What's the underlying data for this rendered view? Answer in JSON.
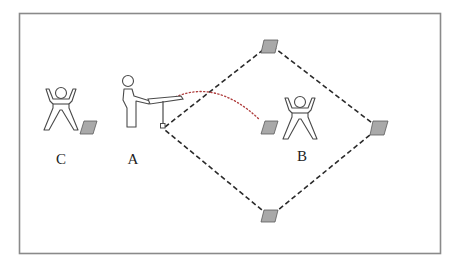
{
  "diagram": {
    "title": "",
    "players": {
      "A": {
        "label": "A",
        "role": "batter"
      },
      "B": {
        "label": "B",
        "role": "fielder"
      },
      "C": {
        "label": "C",
        "role": "catcher"
      }
    },
    "bases": [
      "home",
      "first",
      "second",
      "third",
      "pitch",
      "back"
    ],
    "colors": {
      "frame": "#8a8a8a",
      "base_fill": "#a9a9a9",
      "base_path": "#2a2a2a",
      "ball_trajectory": "#b04040",
      "figure_stroke": "#4a4a4a"
    }
  }
}
